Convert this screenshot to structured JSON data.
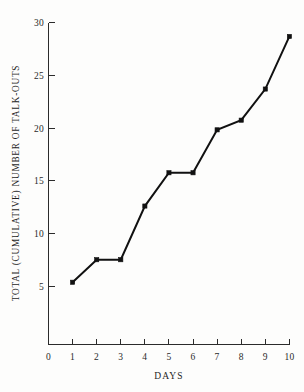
{
  "chart_data": {
    "type": "line",
    "title": "",
    "subtitle": "",
    "xlabel": "DAYS",
    "ylabel": "TOTAL (CUMULATIVE) NUMBER OF TALK-OUTS",
    "x": [
      1,
      2,
      3,
      4,
      5,
      6,
      7,
      8,
      9,
      10
    ],
    "values": [
      5.8,
      7.9,
      7.9,
      12.9,
      16,
      16,
      20,
      20.9,
      23.8,
      28.7
    ],
    "series": [
      {
        "name": "Cumulative talk-outs",
        "values": [
          5.8,
          7.9,
          7.9,
          12.9,
          16,
          16,
          20,
          20.9,
          23.8,
          28.7
        ]
      }
    ],
    "xlim": [
      0,
      10
    ],
    "ylim": [
      0,
      30
    ],
    "xticks": [
      0,
      1,
      2,
      3,
      4,
      5,
      6,
      7,
      8,
      9,
      10
    ],
    "xticklabels": [
      "0",
      "1",
      "2",
      "3",
      "4",
      "5",
      "6",
      "7",
      "8",
      "9",
      "10"
    ],
    "yticks": [
      5,
      10,
      15,
      20,
      25,
      30
    ],
    "yticklabels": [
      "5",
      "10",
      "15",
      "20",
      "25",
      "30"
    ],
    "grid": false,
    "legend": false,
    "legend_position": "none",
    "marker": "square",
    "line_color": "#111111",
    "marker_color": "#111111",
    "background_color": "#fdfdfc"
  },
  "axes": {
    "y_title": "TOTAL (CUMULATIVE) NUMBER OF TALK-OUTS",
    "x_title": "DAYS"
  }
}
